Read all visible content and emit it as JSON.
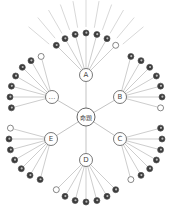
{
  "diagram": {
    "type": "radial-hierarchy",
    "center": {
      "label": "命題",
      "x": 86,
      "y": 117,
      "r": 9
    },
    "hubs": [
      {
        "id": "A",
        "label": "A",
        "x": 86,
        "y": 75,
        "r": 6.5,
        "leaf_count": 7,
        "fan_direction": "up"
      },
      {
        "id": "B",
        "label": "B",
        "x": 120,
        "y": 97,
        "r": 6.5,
        "leaf_count": 7,
        "fan_direction": "upper-right"
      },
      {
        "id": "C",
        "label": "C",
        "x": 120,
        "y": 139,
        "r": 6.5,
        "leaf_count": 7,
        "fan_direction": "lower-right"
      },
      {
        "id": "D",
        "label": "D",
        "x": 86,
        "y": 160,
        "r": 6.5,
        "leaf_count": 7,
        "fan_direction": "down"
      },
      {
        "id": "E",
        "label": "E",
        "x": 51,
        "y": 139,
        "r": 6.5,
        "leaf_count": 7,
        "fan_direction": "lower-left"
      },
      {
        "id": "more",
        "label": "…",
        "x": 52,
        "y": 97,
        "r": 6.5,
        "leaf_count": 7,
        "fan_direction": "upper-left"
      }
    ],
    "top_rays": {
      "count": 11,
      "note": "unlabeled lines radiating above node A's leaves"
    },
    "colors": {
      "line": "#9a9a9a",
      "hub_stroke": "#555555",
      "leaf_fill": "#3a3a3a",
      "leaf_hollow_stroke": "#555555",
      "background": "#ffffff"
    }
  }
}
